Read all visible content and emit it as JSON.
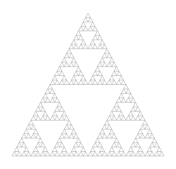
{
  "figure": {
    "name": "sierpinski-triangle",
    "type": "fractal",
    "canvas": {
      "width": 176,
      "height": 169,
      "background_color": "#ffffff"
    },
    "geometry": {
      "apex": {
        "x": 88,
        "y": 13
      },
      "bottom_left": {
        "x": 12,
        "y": 156
      },
      "bottom_right": {
        "x": 164,
        "y": 156
      },
      "base_width": 152,
      "height": 143
    },
    "rendering": {
      "depth": 5,
      "smallest_triangles_across_base": 32,
      "total_smallest_triangles": 243,
      "stroke_color": "#a0a0a0",
      "stroke_width": 0.45,
      "fill": "none",
      "fill_color": "none"
    }
  }
}
